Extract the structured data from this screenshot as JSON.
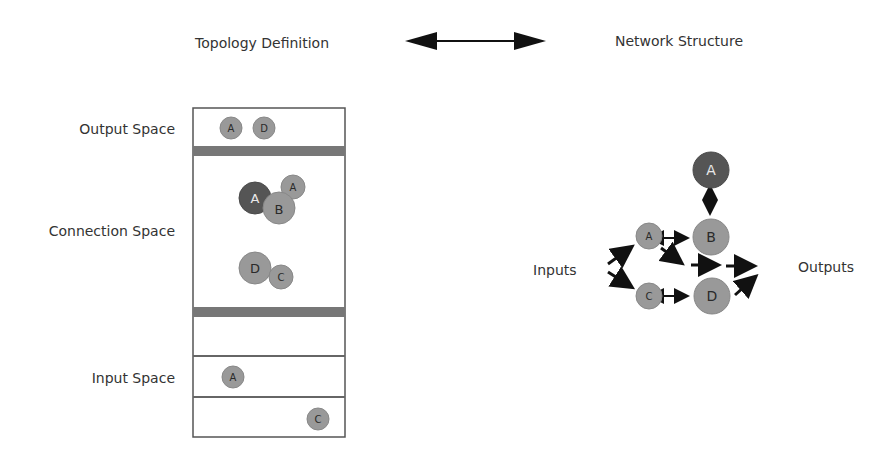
{
  "header": {
    "left_title": "Topology Definition",
    "right_title": "Network Structure"
  },
  "topology": {
    "labels": {
      "output": "Output Space",
      "connection": "Connection Space",
      "input": "Input Space"
    },
    "output_nodes": [
      "A",
      "D"
    ],
    "connection_nodes": [
      "A",
      "B",
      "A",
      "D",
      "C"
    ],
    "input_nodes": [
      "A",
      "C"
    ]
  },
  "network": {
    "labels": {
      "inputs": "Inputs",
      "outputs": "Outputs"
    },
    "nodes": {
      "top_a": "A",
      "b": "B",
      "a": "A",
      "c": "C",
      "d": "D"
    }
  },
  "colors": {
    "node_gray": "#999999",
    "node_dark": "#555555",
    "node_stroke": "#7a7a7a",
    "divider": "#777777",
    "border": "#555555",
    "arrow": "#111111"
  }
}
